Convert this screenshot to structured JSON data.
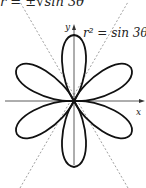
{
  "figure": {
    "top_equation": "r = ±√sin 3θ",
    "curve_label": "r² = sin 3θ",
    "x_axis_label": "x",
    "y_axis_label": "y",
    "petal_count": 6,
    "asymptote_angles_deg": [
      60,
      120
    ],
    "curve_color": "#111111",
    "dashed_color": "#888888"
  }
}
